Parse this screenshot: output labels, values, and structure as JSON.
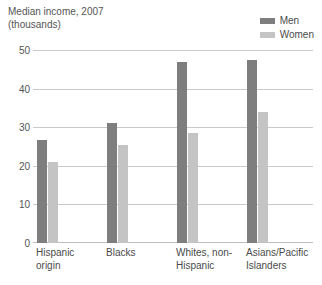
{
  "chart_data": {
    "type": "bar",
    "title": "Median income, 2007",
    "subtitle": "(thousands)",
    "xlabel": "",
    "ylabel": "",
    "ylim": [
      0,
      50
    ],
    "yticks": [
      0,
      10,
      20,
      30,
      40,
      50
    ],
    "grid": true,
    "legend_position": "top-right",
    "categories": [
      "Hispanic origin",
      "Blacks",
      "Whites, non-Hispanic",
      "Asians/Pacific Islanders"
    ],
    "category_lines": [
      [
        "Hispanic",
        "origin"
      ],
      [
        "Blacks",
        ""
      ],
      [
        "Whites, non-",
        "Hispanic"
      ],
      [
        "Asians/Pacific",
        "Islanders"
      ]
    ],
    "series": [
      {
        "name": "Men",
        "color": "#7e7e7e",
        "values": [
          26.7,
          31.0,
          47.0,
          47.4
        ]
      },
      {
        "name": "Women",
        "color": "#c4c4c4",
        "values": [
          21.0,
          25.4,
          28.5,
          33.9
        ]
      }
    ]
  }
}
